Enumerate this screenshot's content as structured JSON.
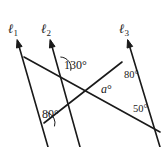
{
  "figure": {
    "type": "geometry-diagram",
    "width": 167,
    "height": 147,
    "stroke_color": "#1a1a1a",
    "background_color": "#ffffff"
  },
  "line_labels": [
    {
      "name": "l1",
      "base": "ℓ",
      "sub": "1",
      "x": 8,
      "y": 22
    },
    {
      "name": "l2",
      "base": "ℓ",
      "sub": "2",
      "x": 41,
      "y": 22
    },
    {
      "name": "l3",
      "base": "ℓ",
      "sub": "3",
      "x": 119,
      "y": 22
    }
  ],
  "angle_labels": [
    {
      "name": "angle-130",
      "text": "130°",
      "x": 64,
      "y": 59,
      "size": "normal"
    },
    {
      "name": "angle-a",
      "text": "a",
      "deg": "°",
      "x": 101,
      "y": 83,
      "size": "normal",
      "italic": true
    },
    {
      "name": "angle-80-right",
      "text": "80°",
      "x": 124,
      "y": 70,
      "size": "small"
    },
    {
      "name": "angle-50",
      "text": "50°",
      "x": 133,
      "y": 104,
      "size": "small"
    },
    {
      "name": "angle-80-left",
      "text": "80°",
      "x": 42,
      "y": 108,
      "size": "normal"
    }
  ],
  "geometry": {
    "lines": [
      {
        "name": "line-l1",
        "x1": 17.5,
        "y1": 41,
        "x2": 48,
        "y2": 147
      },
      {
        "name": "line-l2",
        "x1": 50.5,
        "y1": 41,
        "x2": 80,
        "y2": 147
      },
      {
        "name": "line-l3",
        "x1": 128,
        "y1": 41,
        "x2": 160,
        "y2": 147
      },
      {
        "name": "transversal-upper",
        "x1": 24,
        "y1": 57,
        "x2": 160,
        "y2": 132
      },
      {
        "name": "transversal-lower",
        "x1": 44,
        "y1": 123,
        "x2": 122,
        "y2": 62
      }
    ],
    "arrowheads": [
      {
        "name": "arrow-l1",
        "x": 17.5,
        "y": 41
      },
      {
        "name": "arrow-l2",
        "x": 50.5,
        "y": 41
      },
      {
        "name": "arrow-l3",
        "x": 128,
        "y": 41
      }
    ],
    "angle_arcs": [
      {
        "name": "arc-130",
        "cx": 60,
        "cy": 68,
        "r": 11
      },
      {
        "name": "arc-80-left",
        "cx": 44,
        "cy": 123,
        "r": 11
      }
    ],
    "intersections": [
      {
        "name": "vertex-l1-upper",
        "x": 24,
        "y": 57
      },
      {
        "name": "vertex-l2-upper",
        "x": 60,
        "y": 68
      },
      {
        "name": "vertex-l3-lower",
        "x": 122,
        "y": 62
      },
      {
        "name": "vertex-l1-lower",
        "x": 44,
        "y": 123
      },
      {
        "name": "vertex-crossing",
        "x": 92,
        "y": 85
      },
      {
        "name": "vertex-bottom-right",
        "x": 160,
        "y": 132
      }
    ]
  }
}
